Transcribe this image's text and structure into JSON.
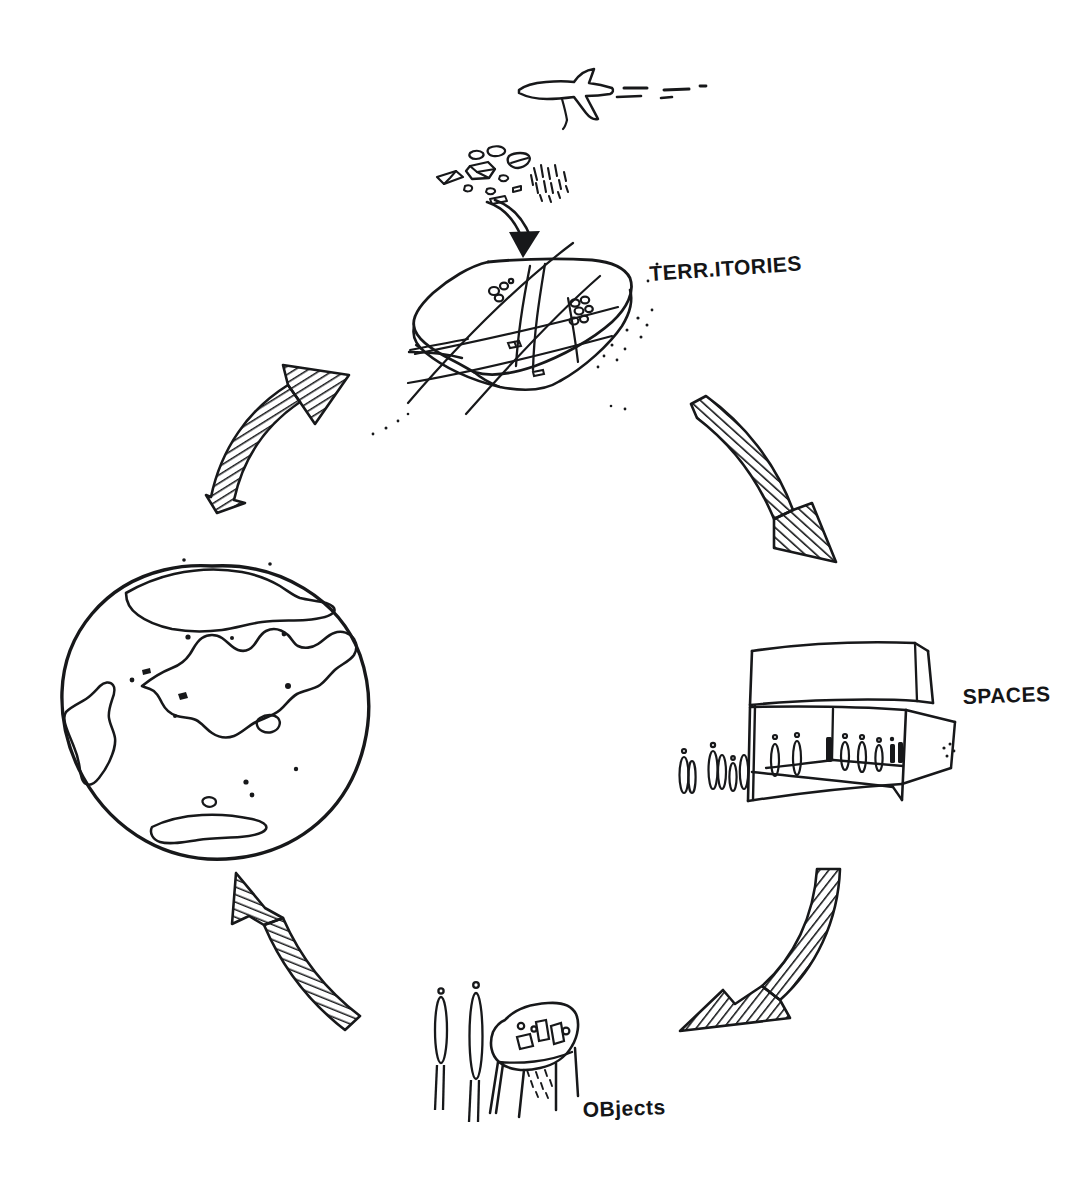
{
  "diagram": {
    "background_color": "#ffffff",
    "ink_color": "#17181a",
    "medium": "hand-drawn pen sketch",
    "cycle_direction": "clockwise"
  },
  "labels": {
    "territories": "TERR.ITORIES",
    "spaces": "SPACES",
    "objects": "OBjects"
  },
  "nodes": [
    {
      "id": "globe",
      "label": "",
      "icon": "globe-sketch",
      "description": "hand-drawn planet earth with continents",
      "position": "left",
      "center_x": 212,
      "center_y": 706
    },
    {
      "id": "territories",
      "label": "TERR.ITORIES",
      "icon": "terrain-slab-sketch",
      "description": "curved land slab with survey grid lines, settlements and falling rocks",
      "position": "top",
      "center_x": 520,
      "center_y": 330
    },
    {
      "id": "spaces",
      "label": "SPACES",
      "icon": "building-interior-sketch",
      "description": "open architectural interior in perspective with human figures",
      "position": "right",
      "center_x": 820,
      "center_y": 730
    },
    {
      "id": "objects",
      "label": "OBjects",
      "icon": "table-objects-sketch",
      "description": "table with small objects on top and two standing figures",
      "position": "bottom",
      "center_x": 510,
      "center_y": 1050
    }
  ],
  "arrows": [
    {
      "id": "arrow-globe-territories",
      "from": "globe",
      "to": "territories",
      "direction": "up-right",
      "style": "hatched-tapered-band"
    },
    {
      "id": "arrow-territories-spaces",
      "from": "territories",
      "to": "spaces",
      "direction": "down-right",
      "style": "hatched-tapered-band"
    },
    {
      "id": "arrow-spaces-objects",
      "from": "spaces",
      "to": "objects",
      "direction": "down-left",
      "style": "hatched-tapered-band"
    },
    {
      "id": "arrow-objects-globe",
      "from": "objects",
      "to": "globe",
      "direction": "up-left",
      "style": "hatched-tapered-band"
    }
  ],
  "decorations": [
    {
      "id": "airplane",
      "icon": "airplane-sketch",
      "description": "airplane flying left with dashed contrail",
      "center_x": 560,
      "center_y": 90
    },
    {
      "id": "falling-rocks",
      "icon": "rocks-debris-sketch",
      "description": "scattered rock chunks above the territories slab",
      "center_x": 495,
      "center_y": 172
    },
    {
      "id": "drop-arrow",
      "icon": "curved-down-arrow-icon",
      "description": "thin curved arrow from rocks down onto the slab",
      "center_x": 505,
      "center_y": 218
    }
  ]
}
